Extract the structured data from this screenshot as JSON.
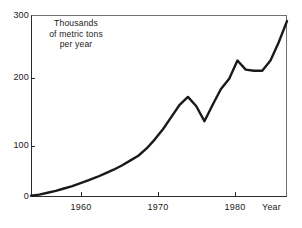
{
  "chart_data": {
    "type": "line",
    "title": "",
    "subtitle": "",
    "xlabel": "Year",
    "ylabel": "Thousands of metric tons per year",
    "annotation_lines": [
      "Thousands",
      "of metric tons",
      "per year"
    ],
    "xlim": [
      1954,
      1985
    ],
    "ylim": [
      0,
      300
    ],
    "xticks": [
      1960,
      1970,
      1980
    ],
    "xtick_labels": [
      "1960",
      "1970",
      "1980"
    ],
    "yticks": [
      0,
      100,
      200,
      300
    ],
    "ytick_labels": [
      "0",
      "100",
      "200",
      "300"
    ],
    "grid": false,
    "legend": "none",
    "line_color": "#1a1a1a",
    "frame_color": "#2b2b2b",
    "background_color": "#ffffff",
    "series": [
      {
        "name": "Production",
        "x": [
          1954,
          1955,
          1956,
          1957,
          1958,
          1959,
          1960,
          1961,
          1962,
          1963,
          1964,
          1965,
          1966,
          1967,
          1968,
          1969,
          1970,
          1971,
          1972,
          1973,
          1974,
          1975,
          1976,
          1977,
          1978,
          1979,
          1980,
          1981,
          1982,
          1983,
          1984,
          1985
        ],
        "values": [
          2,
          4,
          7,
          10,
          14,
          18,
          23,
          28,
          33,
          39,
          45,
          52,
          60,
          68,
          80,
          95,
          112,
          132,
          152,
          165,
          150,
          125,
          152,
          178,
          195,
          225,
          210,
          208,
          208,
          225,
          255,
          290
        ]
      }
    ]
  }
}
